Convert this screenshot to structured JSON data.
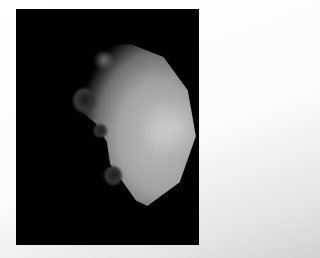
{
  "image": {
    "subject": "moon",
    "description": "Grayscale photo of a cratered moon crescent on a black background",
    "colors": {
      "background": "#000000",
      "surface": "#a3a3a3",
      "page": "#ffffff"
    }
  }
}
